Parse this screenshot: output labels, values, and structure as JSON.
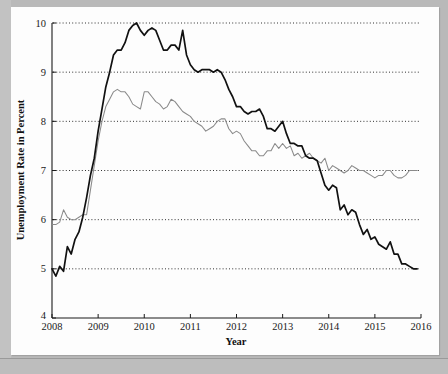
{
  "chart_data": {
    "type": "line",
    "title": "",
    "xlabel": "Year",
    "ylabel": "Unemployment Rate in Percent",
    "xlim": [
      2008.0,
      2016.0
    ],
    "ylim": [
      4,
      10
    ],
    "xticks": [
      "2008",
      "2009",
      "2010",
      "2011",
      "2012",
      "2013",
      "2014",
      "2015",
      "2016"
    ],
    "xtick_values": [
      2008,
      2009,
      2010,
      2011,
      2012,
      2013,
      2014,
      2015,
      2016
    ],
    "yticks": [
      "4",
      "5",
      "6",
      "7",
      "8",
      "9",
      "10"
    ],
    "ytick_values": [
      4,
      5,
      6,
      7,
      8,
      9,
      10
    ],
    "grid": "horizontal-dotted",
    "gridline_values": [
      5,
      6,
      7,
      8,
      9,
      10
    ],
    "legend": "none",
    "colors": {
      "series_primary": "#111111",
      "series_secondary": "#8a8a8a",
      "background": "#fdfdfd",
      "page_surround": "#b9b9b9",
      "axis": "#1a1a1a"
    },
    "series": [
      {
        "name": "Actual Unemployment Rate",
        "style": "solid-thick-black",
        "x_start": 2008.0,
        "x_step": 0.08333,
        "values": [
          5.0,
          4.85,
          5.05,
          4.95,
          5.45,
          5.3,
          5.6,
          5.75,
          6.05,
          6.45,
          6.9,
          7.25,
          7.8,
          8.25,
          8.7,
          9.0,
          9.35,
          9.45,
          9.45,
          9.6,
          9.85,
          9.95,
          10.0,
          9.85,
          9.75,
          9.85,
          9.9,
          9.85,
          9.65,
          9.45,
          9.45,
          9.55,
          9.55,
          9.45,
          9.85,
          9.35,
          9.15,
          9.05,
          9.0,
          9.05,
          9.05,
          9.05,
          9.0,
          9.05,
          9.0,
          8.85,
          8.65,
          8.5,
          8.3,
          8.3,
          8.2,
          8.15,
          8.2,
          8.2,
          8.25,
          8.1,
          7.85,
          7.85,
          7.8,
          7.9,
          8.0,
          7.75,
          7.55,
          7.55,
          7.5,
          7.5,
          7.3,
          7.25,
          7.25,
          7.2,
          6.95,
          6.7,
          6.6,
          6.7,
          6.65,
          6.2,
          6.3,
          6.1,
          6.2,
          6.15,
          5.9,
          5.7,
          5.8,
          5.6,
          5.65,
          5.5,
          5.45,
          5.4,
          5.55,
          5.3,
          5.3,
          5.1,
          5.1,
          5.05,
          5.0,
          5.0
        ]
      },
      {
        "name": "Alternative Unemployment Measure",
        "style": "solid-thin-gray",
        "x_start": 2008.0,
        "x_step": 0.08333,
        "values": [
          5.9,
          5.9,
          5.95,
          6.2,
          6.05,
          6.0,
          6.0,
          6.05,
          6.1,
          6.1,
          6.6,
          7.1,
          7.6,
          8.0,
          8.3,
          8.45,
          8.6,
          8.65,
          8.6,
          8.6,
          8.5,
          8.35,
          8.3,
          8.25,
          8.6,
          8.6,
          8.5,
          8.4,
          8.35,
          8.25,
          8.3,
          8.45,
          8.4,
          8.3,
          8.2,
          8.15,
          8.1,
          8.0,
          7.95,
          7.9,
          7.8,
          7.85,
          7.9,
          8.0,
          8.05,
          8.05,
          7.85,
          7.75,
          7.8,
          7.75,
          7.6,
          7.5,
          7.4,
          7.4,
          7.3,
          7.3,
          7.4,
          7.4,
          7.55,
          7.45,
          7.55,
          7.45,
          7.5,
          7.3,
          7.35,
          7.25,
          7.3,
          7.35,
          7.25,
          7.2,
          7.15,
          7.25,
          7.0,
          7.1,
          7.05,
          7.0,
          6.95,
          7.0,
          7.1,
          7.05,
          7.0,
          7.0,
          6.95,
          6.9,
          6.85,
          6.9,
          6.9,
          7.0,
          7.0,
          6.9,
          6.85,
          6.85,
          6.9,
          7.0,
          7.0,
          7.0
        ]
      }
    ]
  }
}
